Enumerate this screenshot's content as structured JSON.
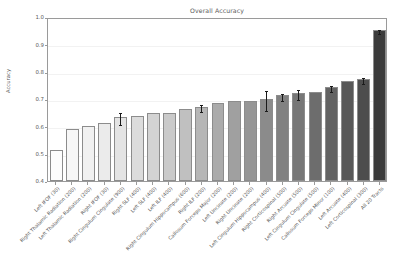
{
  "chart_data": {
    "type": "bar",
    "title": "Overall Accuracy",
    "xlabel": "",
    "ylabel": "Accuracy",
    "ylim": [
      0.4,
      1.0
    ],
    "yticks": [
      "0.4",
      "0.5",
      "0.6",
      "0.7",
      "0.8",
      "0.9",
      "1.0"
    ],
    "grid": true,
    "legend": "none",
    "categories": [
      "Left IFOF (30)",
      "Right Thalamic Radiation (200)",
      "Left Thalamic Radiation (200)",
      "Right IFOF (30)",
      "Right Cingulum Cingulate (900)",
      "Right SLF (400)",
      "Left SLF (400)",
      "Left ILF (400)",
      "Right Cingulum Hippocampus (600)",
      "Right ILF (200)",
      "Callosum Forceps Major (200)",
      "Left Uncinate (200)",
      "Right Uncinate (200)",
      "Left Cingulum Hippocampus (400)",
      "Right Corticospinal (500)",
      "Right Arcuate (500)",
      "Left Cingulum Cingulate (500)",
      "Callosum Forceps Minor (100)",
      "Left Arcuate (400)",
      "Left Corticospinal (300)",
      "All 20 Tracts"
    ],
    "values": [
      0.515,
      0.592,
      0.602,
      0.612,
      0.633,
      0.638,
      0.648,
      0.648,
      0.664,
      0.672,
      0.687,
      0.694,
      0.693,
      0.7,
      0.713,
      0.721,
      0.726,
      0.745,
      0.765,
      0.773,
      0.952
    ],
    "errors": [
      0.0,
      0.0,
      0.0,
      0.0,
      0.022,
      0.0,
      0.0,
      0.0,
      0.0,
      0.012,
      0.0,
      0.0,
      0.0,
      0.035,
      0.014,
      0.018,
      0.0,
      0.011,
      0.0,
      0.011,
      0.007
    ],
    "bar_colors": [
      "#fdfdfd",
      "#f7f7f7",
      "#f1f1f1",
      "#ebebeb",
      "#e4e4e4",
      "#dcdcdc",
      "#d3d3d3",
      "#cacaca",
      "#c0c0c0",
      "#b6b6b6",
      "#ababab",
      "#a0a0a0",
      "#969696",
      "#8b8b8b",
      "#818181",
      "#777777",
      "#6d6d6d",
      "#636363",
      "#585858",
      "#4d4d4d",
      "#3b3b3b"
    ],
    "errorbar_color": "#1a1a1a",
    "axis_color": "#9a9a9a",
    "text_color": "#5a5a5a"
  }
}
